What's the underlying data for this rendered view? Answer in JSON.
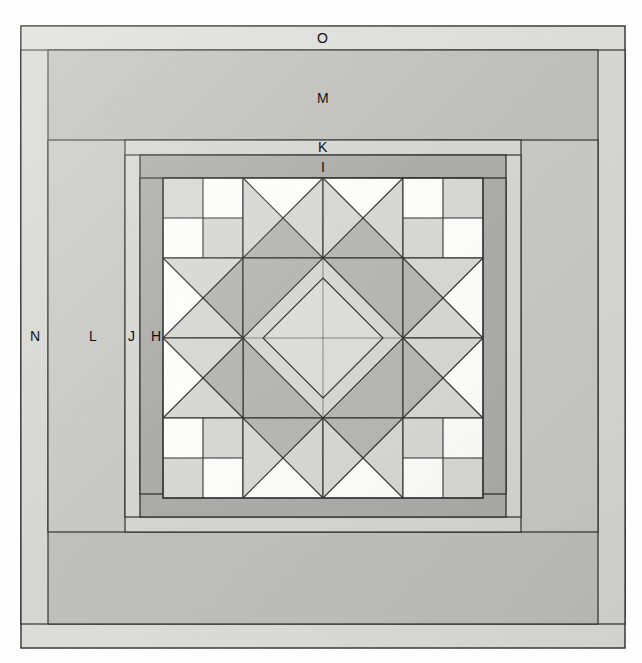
{
  "figure": {
    "canvas": {
      "width": 642,
      "height": 663
    },
    "background": "#ffffff"
  },
  "palette": {
    "white": "#ffffff",
    "near_white": "#fbfbfa",
    "light": "#d8d8d4",
    "light_alt": "#dedede",
    "medium": "#b8b8b4",
    "medium_dark": "#a9a9a5",
    "dark": "#9c9c98",
    "outline": "#2b2b2b",
    "hairline": "#55555 0",
    "page": "#ffffff"
  },
  "labels": [
    {
      "id": "O",
      "text": "O",
      "x": 322,
      "y": 38,
      "desc": "outermost border strip"
    },
    {
      "id": "M",
      "text": "M",
      "x": 322,
      "y": 98,
      "desc": "wide second border"
    },
    {
      "id": "K",
      "text": "K",
      "x": 322,
      "y": 147,
      "desc": "narrow third border"
    },
    {
      "id": "I",
      "text": "I",
      "x": 322,
      "y": 167,
      "desc": "inner dark border"
    },
    {
      "id": "N",
      "text": "N",
      "x": 35,
      "y": 336,
      "desc": "outer side border"
    },
    {
      "id": "L",
      "text": "L",
      "x": 94,
      "y": 336,
      "desc": "wide side border"
    },
    {
      "id": "J",
      "text": "J",
      "x": 132,
      "y": 336,
      "desc": "narrow side border"
    },
    {
      "id": "H",
      "text": "H",
      "x": 156,
      "y": 336,
      "desc": "innermost side border"
    }
  ],
  "borders": [
    {
      "letter": "O",
      "name": "outer-border",
      "fill": "#d8d8d4",
      "x": 21,
      "y": 26,
      "w": 604,
      "h": 622
    },
    {
      "letter": "N",
      "name": "outer-side-border",
      "fill": "#d8d8d4",
      "x": 21,
      "y": 50,
      "w": 604,
      "h": 574
    },
    {
      "letter": "M",
      "name": "wide-border",
      "fill": "#c3c3bf",
      "x": 48,
      "y": 50,
      "w": 550,
      "h": 574
    },
    {
      "letter": "L",
      "name": "wide-side-border",
      "fill": "#c7c7c3",
      "x": 48,
      "y": 140,
      "w": 550,
      "h": 392
    },
    {
      "letter": "K",
      "name": "narrow-border",
      "fill": "#d2d2ce",
      "x": 125,
      "y": 140,
      "w": 396,
      "h": 392
    },
    {
      "letter": "J",
      "name": "narrow-side-border",
      "fill": "#d2d2ce",
      "x": 125,
      "y": 155,
      "w": 396,
      "h": 362
    },
    {
      "letter": "I",
      "name": "inner-dark-border",
      "fill": "#a9a9a5",
      "x": 140,
      "y": 155,
      "w": 366,
      "h": 362
    },
    {
      "letter": "H",
      "name": "inner-side-border",
      "fill": "#a9a9a5",
      "x": 140,
      "y": 178,
      "w": 366,
      "h": 316
    }
  ],
  "block": {
    "name": "center-star-block",
    "x": 163,
    "y": 178,
    "w": 320,
    "h": 320,
    "grid": 4,
    "cell": 80,
    "units": [
      {
        "row": 0,
        "col": 0,
        "type": "four-patch",
        "name": "four-patch-top-left",
        "patches": [
          "light",
          "white",
          "white",
          "light"
        ]
      },
      {
        "row": 0,
        "col": 1,
        "type": "quarter-square-triangle",
        "name": "star-point-top-left",
        "triangles": {
          "top": "white",
          "right": "light",
          "bottom": "medium",
          "left": "light"
        }
      },
      {
        "row": 0,
        "col": 2,
        "type": "quarter-square-triangle",
        "name": "star-point-top-right",
        "triangles": {
          "top": "white",
          "right": "light",
          "bottom": "medium",
          "left": "light"
        }
      },
      {
        "row": 0,
        "col": 3,
        "type": "four-patch",
        "name": "four-patch-top-right",
        "patches": [
          "white",
          "light",
          "light",
          "white"
        ]
      },
      {
        "row": 1,
        "col": 0,
        "type": "quarter-square-triangle",
        "name": "star-point-left-top",
        "triangles": {
          "top": "light",
          "right": "medium",
          "bottom": "light",
          "left": "white"
        }
      },
      {
        "row": 1,
        "col": 1,
        "type": "square-in-square-quadrant",
        "name": "center-quadrant-top-left",
        "triangles": {
          "outer": "medium",
          "inner": "light"
        }
      },
      {
        "row": 1,
        "col": 2,
        "type": "square-in-square-quadrant",
        "name": "center-quadrant-top-right",
        "triangles": {
          "outer": "medium",
          "inner": "light"
        }
      },
      {
        "row": 1,
        "col": 3,
        "type": "quarter-square-triangle",
        "name": "star-point-right-top",
        "triangles": {
          "top": "light",
          "right": "white",
          "bottom": "light",
          "left": "medium"
        }
      },
      {
        "row": 2,
        "col": 0,
        "type": "quarter-square-triangle",
        "name": "star-point-left-bottom",
        "triangles": {
          "top": "light",
          "right": "medium",
          "bottom": "light",
          "left": "white"
        }
      },
      {
        "row": 2,
        "col": 1,
        "type": "square-in-square-quadrant",
        "name": "center-quadrant-bottom-left",
        "triangles": {
          "outer": "medium",
          "inner": "light"
        }
      },
      {
        "row": 2,
        "col": 2,
        "type": "square-in-square-quadrant",
        "name": "center-quadrant-bottom-right",
        "triangles": {
          "outer": "medium",
          "inner": "light"
        }
      },
      {
        "row": 2,
        "col": 3,
        "type": "quarter-square-triangle",
        "name": "star-point-right-bottom",
        "triangles": {
          "top": "light",
          "right": "white",
          "bottom": "light",
          "left": "medium"
        }
      },
      {
        "row": 3,
        "col": 0,
        "type": "four-patch",
        "name": "four-patch-bottom-left",
        "patches": [
          "white",
          "light",
          "light",
          "white"
        ]
      },
      {
        "row": 3,
        "col": 1,
        "type": "quarter-square-triangle",
        "name": "star-point-bottom-left",
        "triangles": {
          "top": "medium",
          "right": "light",
          "bottom": "white",
          "left": "light"
        }
      },
      {
        "row": 3,
        "col": 2,
        "type": "quarter-square-triangle",
        "name": "star-point-bottom-right",
        "triangles": {
          "top": "medium",
          "right": "light",
          "bottom": "white",
          "left": "light"
        }
      },
      {
        "row": 3,
        "col": 3,
        "type": "four-patch",
        "name": "four-patch-bottom-right",
        "patches": [
          "light",
          "white",
          "white",
          "light"
        ]
      }
    ],
    "center_diamond": {
      "name": "center-diamond",
      "fill": "light",
      "size": 113
    }
  }
}
